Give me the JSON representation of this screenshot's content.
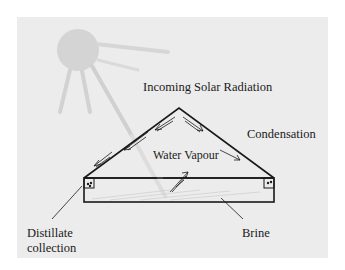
{
  "diagram": {
    "labels": {
      "incoming_radiation": "Incoming Solar Radiation",
      "condensation": "Condensation",
      "water_vapour": "Water Vapour",
      "distillate_line1": "Distillate",
      "distillate_line2": "collection",
      "brine": "Brine"
    },
    "colors": {
      "background": "#ececec",
      "sun": "#d4d4d4",
      "rays": "#d0d0d0",
      "lines": "#1a1a1a"
    },
    "icons": [
      "sun-icon",
      "arrow-icon"
    ]
  }
}
